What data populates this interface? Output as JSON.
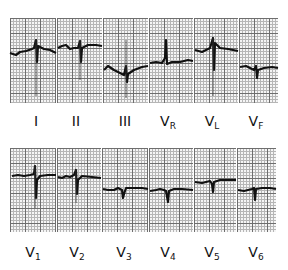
{
  "figure": {
    "rows": [
      {
        "leads": [
          {
            "name": "I",
            "main": "I",
            "sub": ""
          },
          {
            "name": "II",
            "main": "II",
            "sub": ""
          },
          {
            "name": "III",
            "main": "III",
            "sub": ""
          },
          {
            "name": "VR",
            "main": "V",
            "sub": "R"
          },
          {
            "name": "VL",
            "main": "V",
            "sub": "L"
          },
          {
            "name": "VF",
            "main": "V",
            "sub": "F"
          }
        ]
      },
      {
        "leads": [
          {
            "name": "V1",
            "main": "V",
            "sub": "1"
          },
          {
            "name": "V2",
            "main": "V",
            "sub": "2"
          },
          {
            "name": "V3",
            "main": "V",
            "sub": "3"
          },
          {
            "name": "V4",
            "main": "V",
            "sub": "4"
          },
          {
            "name": "V5",
            "main": "V",
            "sub": "5"
          },
          {
            "name": "V6",
            "main": "V",
            "sub": "6"
          }
        ]
      }
    ]
  }
}
